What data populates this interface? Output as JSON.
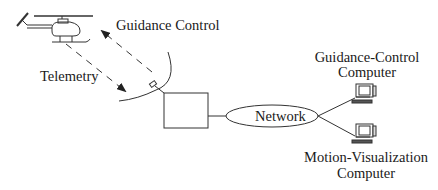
{
  "diagram": {
    "labels": {
      "guidance_control": "Guidance Control",
      "telemetry": "Telemetry",
      "network": "Network",
      "guidance_computer_line1": "Guidance-Control",
      "guidance_computer_line2": "Computer",
      "motion_computer_line1": "Motion-Visualization",
      "motion_computer_line2": "Computer"
    },
    "nodes": [
      {
        "id": "helicopter",
        "icon": "helicopter-icon"
      },
      {
        "id": "dish-antenna",
        "icon": "satellite-dish-icon"
      },
      {
        "id": "base-station",
        "shape": "rectangle"
      },
      {
        "id": "network",
        "shape": "ellipse",
        "label": "Network"
      },
      {
        "id": "guidance-control-computer",
        "icon": "computer-icon",
        "label": "Guidance-Control Computer"
      },
      {
        "id": "motion-visualization-computer",
        "icon": "computer-icon",
        "label": "Motion-Visualization Computer"
      }
    ],
    "edges": [
      {
        "from": "dish-antenna",
        "to": "helicopter",
        "label": "Guidance Control",
        "style": "dashed-arrow"
      },
      {
        "from": "helicopter",
        "to": "dish-antenna",
        "label": "Telemetry",
        "style": "dashed-arrow"
      },
      {
        "from": "dish-antenna",
        "to": "base-station",
        "style": "solid"
      },
      {
        "from": "base-station",
        "to": "network",
        "style": "solid"
      },
      {
        "from": "network",
        "to": "guidance-control-computer",
        "style": "solid"
      },
      {
        "from": "network",
        "to": "motion-visualization-computer",
        "style": "solid"
      }
    ],
    "colors": {
      "stroke": "#333333",
      "background": "#ffffff"
    }
  }
}
